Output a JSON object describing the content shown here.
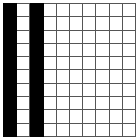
{
  "figure": {
    "name": "binary-cell-grid",
    "rows": 10,
    "columns": 10,
    "cell_size_px": 13,
    "colors": {
      "filled_cell": "#000000",
      "empty_cell": "#ffffff",
      "grid_line": "#555555",
      "background": "#ffffff"
    },
    "filled_columns": [
      1,
      3
    ],
    "filled_rows": [
      1,
      2,
      3,
      4,
      5,
      6,
      7,
      8,
      9,
      10
    ],
    "filled_cell_count": 20,
    "empty_cell_count": 80
  },
  "chart_data": {
    "type": "heatmap",
    "title": "",
    "xlabel": "",
    "ylabel": "",
    "categories": [
      "1",
      "2",
      "3",
      "4",
      "5",
      "6",
      "7",
      "8",
      "9",
      "10"
    ],
    "row_labels": [
      "1",
      "2",
      "3",
      "4",
      "5",
      "6",
      "7",
      "8",
      "9",
      "10"
    ],
    "grid": [
      [
        1,
        0,
        1,
        0,
        0,
        0,
        0,
        0,
        0,
        0
      ],
      [
        1,
        0,
        1,
        0,
        0,
        0,
        0,
        0,
        0,
        0
      ],
      [
        1,
        0,
        1,
        0,
        0,
        0,
        0,
        0,
        0,
        0
      ],
      [
        1,
        0,
        1,
        0,
        0,
        0,
        0,
        0,
        0,
        0
      ],
      [
        1,
        0,
        1,
        0,
        0,
        0,
        0,
        0,
        0,
        0
      ],
      [
        1,
        0,
        1,
        0,
        0,
        0,
        0,
        0,
        0,
        0
      ],
      [
        1,
        0,
        1,
        0,
        0,
        0,
        0,
        0,
        0,
        0
      ],
      [
        1,
        0,
        1,
        0,
        0,
        0,
        0,
        0,
        0,
        0
      ],
      [
        1,
        0,
        1,
        0,
        0,
        0,
        0,
        0,
        0,
        0
      ],
      [
        1,
        0,
        1,
        0,
        0,
        0,
        0,
        0,
        0,
        0
      ]
    ],
    "value_map": {
      "0": "#ffffff",
      "1": "#000000"
    },
    "grid_lines": true,
    "legend": []
  }
}
